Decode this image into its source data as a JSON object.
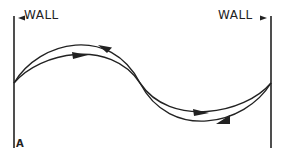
{
  "diagram": {
    "left_wall_label": "WALL",
    "right_wall_label": "WALL",
    "panel_label": "A",
    "left_wall_arrow": "◄",
    "right_wall_arrow": "►",
    "stroke_color": "#222222",
    "background_color": "#ffffff"
  }
}
